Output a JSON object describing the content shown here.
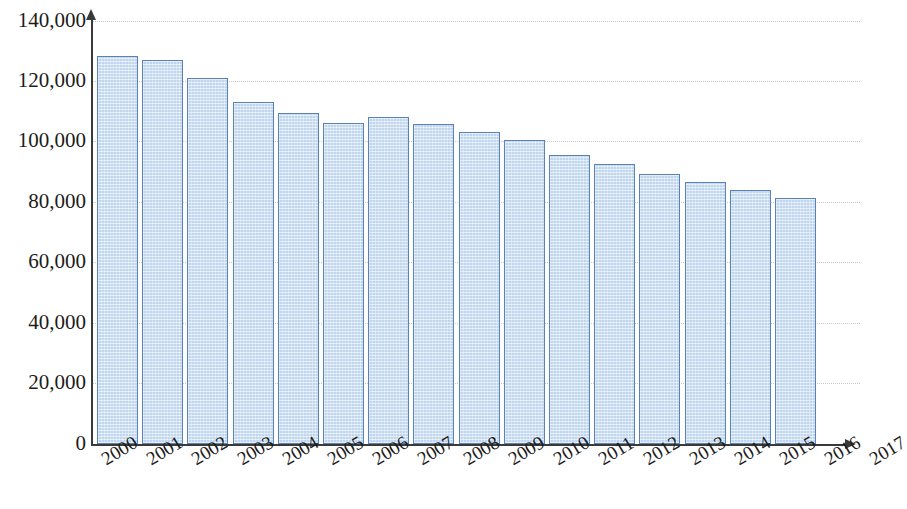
{
  "chart_data": {
    "type": "bar",
    "title": "",
    "subtitle": "",
    "xlabel": "",
    "ylabel": "",
    "categories": [
      "2000",
      "2001",
      "2002",
      "2003",
      "2004",
      "2005",
      "2006",
      "2007",
      "2008",
      "2009",
      "2010",
      "2011",
      "2012",
      "2013",
      "2014",
      "2015",
      "2016",
      "2017"
    ],
    "values": [
      128500,
      127000,
      121300,
      113200,
      109600,
      106300,
      108200,
      105800,
      103300,
      100500,
      95800,
      92800,
      89400,
      86700,
      84100,
      81400,
      null,
      null
    ],
    "series": [
      {
        "name": "",
        "values": [
          128500,
          127000,
          121300,
          113200,
          109600,
          106300,
          108200,
          105800,
          103300,
          100500,
          95800,
          92800,
          89400,
          86700,
          84100,
          81400,
          null,
          null
        ]
      }
    ],
    "ylim": [
      0,
      140000
    ],
    "ytick_values": [
      0,
      20000,
      40000,
      60000,
      80000,
      100000,
      120000,
      140000
    ],
    "ytick_labels": [
      "0",
      "20,000",
      "40,000",
      "60,000",
      "80,000",
      "100,000",
      "120,000",
      "140,000"
    ],
    "xtick_labels": [
      "2000",
      "2001",
      "2002",
      "2003",
      "2004",
      "2005",
      "2006",
      "2007",
      "2008",
      "2009",
      "2010",
      "2011",
      "2012",
      "2013",
      "2014",
      "2015",
      "2016",
      "2017"
    ],
    "grid": true,
    "grid_axis": "y",
    "legend": false,
    "legend_position": "none",
    "annotations": [],
    "bar_fill_color": "#c0d6ee",
    "bar_border_color": "#5a82b4",
    "grid_color": "#c9c9c9",
    "axis_color": "#3a3a3a",
    "text_color": "#1c1c1c",
    "background_color": "#ffffff",
    "note": "Bars shown for 2000-2015; categories 2016 and 2017 have axis labels but no bars."
  }
}
